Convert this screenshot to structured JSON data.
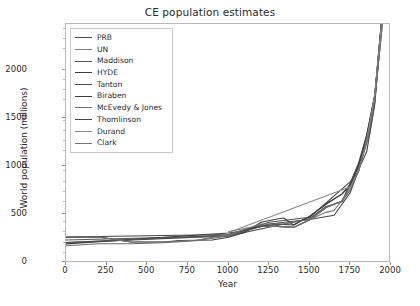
{
  "chart_data": {
    "type": "line",
    "title": "CE population estimates",
    "xlabel": "Year",
    "ylabel": "World population (millions)",
    "xlim": [
      0,
      2000
    ],
    "ylim": [
      0,
      2350
    ],
    "xticks": [
      0,
      250,
      500,
      750,
      1000,
      1250,
      1500,
      1750,
      2000
    ],
    "yticks": [
      0,
      500,
      1000,
      1500,
      2000
    ],
    "grid": false,
    "legend_position": "upper left",
    "series": [
      {
        "name": "PRB",
        "color": "#4c4c4c",
        "x": [
          1,
          1000,
          1200,
          1300,
          1400,
          1500,
          1600,
          1700,
          1750,
          1800,
          1850,
          1900,
          1950
        ],
        "y": [
          200,
          265,
          360,
          360,
          350,
          425,
          545,
          610,
          790,
          980,
          1260,
          1650,
          2520
        ]
      },
      {
        "name": "UN",
        "color": "#7f7f7f",
        "x": [
          1000,
          1100,
          1200,
          1300,
          1400,
          1500,
          1600,
          1700,
          1800,
          1850,
          1900,
          1950
        ],
        "y": [
          310,
          340,
          360,
          360,
          350,
          425,
          545,
          610,
          900,
          1200,
          1625,
          2500
        ]
      },
      {
        "name": "Maddison",
        "color": "#595959",
        "x": [
          1,
          1000,
          1500,
          1600,
          1700,
          1820,
          1870,
          1900,
          1913,
          1940,
          1950
        ],
        "y": [
          226,
          267,
          438,
          556,
          603,
          1042,
          1276,
          1563,
          1793,
          2300,
          2528
        ]
      },
      {
        "name": "HYDE",
        "color": "#3f3f3f",
        "x": [
          1,
          1000,
          1100,
          1200,
          1300,
          1400,
          1500,
          1600,
          1700,
          1750,
          1800,
          1850,
          1900,
          1950
        ],
        "y": [
          188,
          295,
          320,
          360,
          382,
          374,
          461,
          578,
          680,
          771,
          954,
          1241,
          1654,
          2529
        ]
      },
      {
        "name": "Tanton",
        "color": "#4f4f4f",
        "x": [
          1,
          1000,
          1250,
          1500,
          1750,
          1800,
          1850,
          1900,
          1950
        ],
        "y": [
          200,
          275,
          400,
          450,
          800,
          900,
          1200,
          1600,
          2400
        ]
      },
      {
        "name": "Biraben",
        "color": "#3c3c3c",
        "x": [
          1,
          200,
          400,
          500,
          600,
          700,
          800,
          900,
          1000,
          1100,
          1200,
          1300,
          1340,
          1400,
          1500,
          1600,
          1700,
          1750,
          1800,
          1850,
          1900,
          1950
        ],
        "y": [
          252,
          257,
          206,
          206,
          207,
          220,
          224,
          226,
          254,
          301,
          400,
          432,
          442,
          374,
          458,
          580,
          682,
          771,
          954,
          1241,
          1634,
          2530
        ]
      },
      {
        "name": "McEvedy & Jones",
        "color": "#6e6e6e",
        "x": [
          1,
          200,
          400,
          600,
          800,
          1000,
          1100,
          1200,
          1300,
          1400,
          1500,
          1600,
          1700,
          1750,
          1800,
          1850,
          1900,
          1950
        ],
        "y": [
          170,
          190,
          190,
          200,
          220,
          265,
          320,
          360,
          360,
          350,
          425,
          545,
          610,
          720,
          900,
          1200,
          1625,
          2500
        ]
      },
      {
        "name": "Thomlinson",
        "color": "#454545",
        "x": [
          1,
          1000,
          1250,
          1500,
          1650,
          1750,
          1800,
          1850,
          1900,
          1950
        ],
        "y": [
          255,
          280,
          384,
          427,
          470,
          694,
          919,
          1091,
          1571,
          2509
        ]
      },
      {
        "name": "Durand",
        "color": "#8a8a8a",
        "x": [
          1000,
          1750,
          1800,
          1850,
          1900,
          1950
        ],
        "y": [
          300,
          750,
          900,
          1200,
          1650,
          2500
        ]
      },
      {
        "name": "Clark",
        "color": "#757575",
        "x": [
          1,
          200,
          400,
          600,
          800,
          1000,
          1200,
          1340,
          1500,
          1600,
          1650,
          1750,
          1800,
          1850,
          1900,
          1950
        ],
        "y": [
          256,
          256,
          206,
          206,
          224,
          280,
          384,
          384,
          427,
          498,
          516,
          728,
          906,
          1171,
          1608,
          2400
        ]
      }
    ]
  }
}
